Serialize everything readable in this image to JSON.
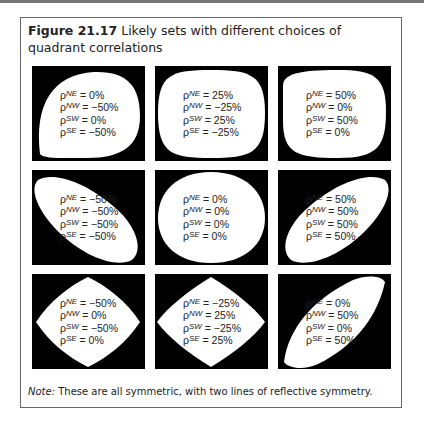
{
  "figure": {
    "number": "Figure 21.17",
    "title": "Likely sets with different choices of quadrant correlations",
    "note_label": "Note:",
    "note_text": "These are all symmetric, with two lines of reflective symmetry."
  },
  "panels": [
    {
      "ne": "0%",
      "nw": "−50%",
      "sw": "0%",
      "se": "−50%"
    },
    {
      "ne": "25%",
      "nw": "−25%",
      "sw": "25%",
      "se": "−25%"
    },
    {
      "ne": "50%",
      "nw": "0%",
      "sw": "50%",
      "se": "0%"
    },
    {
      "ne": "−50%",
      "nw": "−50%",
      "sw": "−50%",
      "se": "−50%"
    },
    {
      "ne": "0%",
      "nw": "0%",
      "sw": "0%",
      "se": "0%"
    },
    {
      "ne": "50%",
      "nw": "50%",
      "sw": "50%",
      "se": "50%"
    },
    {
      "ne": "−50%",
      "nw": "0%",
      "sw": "−50%",
      "se": "0%"
    },
    {
      "ne": "−25%",
      "nw": "25%",
      "sw": "−25%",
      "se": "25%"
    },
    {
      "ne": "0%",
      "nw": "50%",
      "sw": "0%",
      "se": "50%"
    }
  ],
  "symbols": {
    "rho": "ρ",
    "ne": "NE",
    "nw": "NW",
    "sw": "SW",
    "se": "SE",
    "eq": " = "
  }
}
